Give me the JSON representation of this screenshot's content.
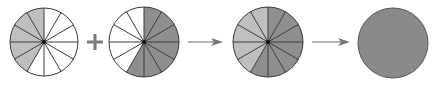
{
  "diagram": {
    "slices": 12,
    "colors": {
      "background": "#ffffff",
      "light_fill": "#bfbfbf",
      "dark_fill": "#8f8f8f",
      "whole_fill": "#8a8a8a",
      "empty_fill": "#ffffff",
      "stroke": "#3a3a3a",
      "operator": "#7a7a7a",
      "center_dot": "#111111"
    },
    "circles": [
      {
        "id": "addend-1",
        "cx": 44,
        "cy": 42,
        "r": 34,
        "shaded": 5,
        "direction": "counterclockwise",
        "fill": "light",
        "divided": true,
        "fraction": "5/12"
      },
      {
        "id": "addend-2",
        "cx": 144,
        "cy": 42,
        "r": 35,
        "shaded": 7,
        "direction": "clockwise",
        "fill": "dark",
        "divided": true,
        "fraction": "7/12"
      },
      {
        "id": "sum-divided",
        "cx": 268,
        "cy": 42,
        "r": 35,
        "shaded_light": 5,
        "shaded_dark": 7,
        "divided": true,
        "fraction": "12/12"
      },
      {
        "id": "sum-whole",
        "cx": 393,
        "cy": 43,
        "r": 35,
        "divided": false,
        "fraction": "1"
      }
    ],
    "operators": [
      {
        "type": "plus",
        "x": 95,
        "y": 42
      },
      {
        "type": "arrow",
        "x1": 188,
        "x2": 223,
        "y": 42
      },
      {
        "type": "arrow",
        "x1": 312,
        "x2": 350,
        "y": 42
      }
    ]
  }
}
